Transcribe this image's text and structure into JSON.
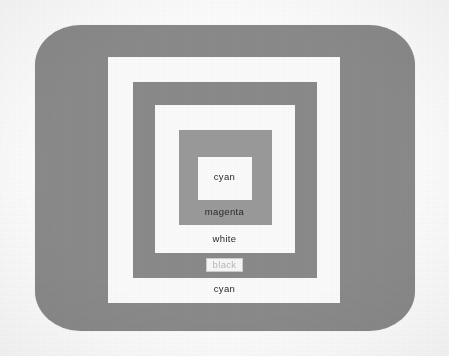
{
  "page": {
    "background": "#ffffff"
  },
  "screen": {
    "name": "crt-screen",
    "fill": "#8a8a8a",
    "x": 35,
    "y": 25,
    "width": 380,
    "height": 306,
    "corner_radius": "46px / 40px"
  },
  "bands": [
    {
      "id": "band-cyan-outer",
      "label": "cyan",
      "fill": "#fbfbfb",
      "text_color": "#2a2a2a",
      "boxed": false,
      "x": 108,
      "y": 57,
      "width": 232,
      "height": 246,
      "label_y": 283
    },
    {
      "id": "band-black",
      "label": "black",
      "fill": "#8a8a8a",
      "text_color": "#b9b9b9",
      "boxed": true,
      "x": 133,
      "y": 82,
      "width": 184,
      "height": 196,
      "label_y": 258
    },
    {
      "id": "band-white",
      "label": "white",
      "fill": "#fbfbfb",
      "text_color": "#2a2a2a",
      "boxed": false,
      "x": 155,
      "y": 105,
      "width": 140,
      "height": 148,
      "label_y": 233
    },
    {
      "id": "band-magenta",
      "label": "magenta",
      "fill": "#9a9a9a",
      "text_color": "#2a2a2a",
      "boxed": false,
      "x": 179,
      "y": 130,
      "width": 93,
      "height": 95,
      "label_y": 206
    },
    {
      "id": "band-cyan-inner",
      "label": "cyan",
      "fill": "#fbfbfb",
      "text_color": "#2a2a2a",
      "boxed": false,
      "x": 198,
      "y": 157,
      "width": 54,
      "height": 43,
      "label_y": 171
    }
  ],
  "labels": {
    "cyan_outer": "cyan",
    "black": "black",
    "white": "white",
    "magenta": "magenta",
    "cyan_inner": "cyan"
  },
  "colors": {
    "screen_gray": "#8a8a8a",
    "band_gray": "#9a9a9a",
    "band_white": "#fbfbfb",
    "text_dark": "#2a2a2a",
    "text_light": "#b9b9b9",
    "page_white": "#ffffff"
  }
}
